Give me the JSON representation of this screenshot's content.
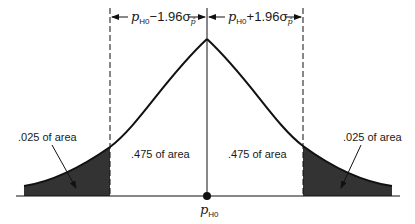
{
  "diagram": {
    "type": "normal-distribution",
    "center_label": {
      "main": "p",
      "sub": "H0"
    },
    "upper_annotations": {
      "left": {
        "p": "p",
        "sub": "H0",
        "op": "−1.96σ",
        "sigma_sub": "p̂"
      },
      "right": {
        "p": "p",
        "sub": "H0",
        "op": "+1.96σ",
        "sigma_sub": "p̂"
      }
    },
    "regions": [
      {
        "id": "left-tail",
        "label": ".025 of area",
        "shaded": true
      },
      {
        "id": "left-center",
        "label": ".475 of area",
        "shaded": false
      },
      {
        "id": "right-center",
        "label": ".475 of area",
        "shaded": false
      },
      {
        "id": "right-tail",
        "label": ".025 of area",
        "shaded": true
      }
    ],
    "colors": {
      "line": "#111111",
      "shade": "#333333",
      "background": "#ffffff"
    }
  }
}
